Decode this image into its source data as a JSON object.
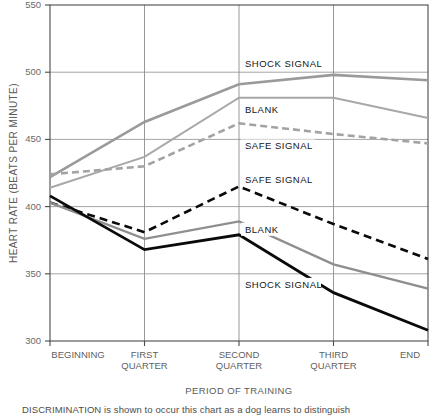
{
  "chart_data": {
    "type": "line",
    "title": "",
    "xlabel": "PERIOD OF TRAINING",
    "ylabel": "HEART RATE (BEATS PER MINUTE)",
    "categories": [
      "BEGINNING",
      "FIRST QUARTER",
      "SECOND QUARTER",
      "THIRD QUARTER",
      "END"
    ],
    "category_lines": [
      [
        "BEGINNING",
        ""
      ],
      [
        "FIRST",
        "QUARTER"
      ],
      [
        "SECOND",
        "QUARTER"
      ],
      [
        "THIRD",
        "QUARTER"
      ],
      [
        "END",
        ""
      ]
    ],
    "ylim": [
      300,
      550
    ],
    "yticks": [
      300,
      350,
      400,
      450,
      500,
      550
    ],
    "ytick_labels": [
      "300",
      "350",
      "400",
      "450",
      "500",
      "550"
    ],
    "grid": true,
    "legend": "inline-annotations",
    "series": [
      {
        "name": "SHOCK SIGNAL (upper)",
        "label": "SHOCK SIGNAL",
        "group": "upper",
        "style": "solid",
        "color": "#9a9a9a",
        "values": [
          422,
          463,
          491,
          498,
          494
        ]
      },
      {
        "name": "BLANK (upper)",
        "label": "BLANK",
        "group": "upper",
        "style": "solid",
        "color": "#a8a8a8",
        "values": [
          414,
          437,
          481,
          481,
          466
        ]
      },
      {
        "name": "SAFE SIGNAL (upper)",
        "label": "SAFE SIGNAL",
        "group": "upper",
        "style": "dashed",
        "color": "#a3a3a3",
        "values": [
          424,
          430,
          462,
          454,
          447
        ]
      },
      {
        "name": "SAFE SIGNAL (lower)",
        "label": "SAFE SIGNAL",
        "group": "lower",
        "style": "dashed",
        "color": "#0a0a0a",
        "values": [
          403,
          381,
          415,
          387,
          361
        ]
      },
      {
        "name": "BLANK (lower)",
        "label": "BLANK",
        "group": "lower",
        "style": "solid",
        "color": "#8e8e8e",
        "values": [
          403,
          376,
          389,
          357,
          339
        ]
      },
      {
        "name": "SHOCK SIGNAL (lower)",
        "label": "SHOCK SIGNAL",
        "group": "lower",
        "style": "solid",
        "color": "#0a0a0a",
        "values": [
          408,
          368,
          379,
          336,
          308
        ]
      }
    ],
    "annotations": [
      {
        "text": "SHOCK SIGNAL",
        "x": 239,
        "y": 505,
        "for": "SHOCK SIGNAL (upper)"
      },
      {
        "text": "BLANK",
        "x": 239,
        "y": 471,
        "for": "BLANK (upper)"
      },
      {
        "text": "SAFE SIGNAL",
        "x": 239,
        "y": 444,
        "for": "SAFE SIGNAL (upper)"
      },
      {
        "text": "SAFE SIGNAL",
        "x": 239,
        "y": 419,
        "for": "SAFE SIGNAL (lower)"
      },
      {
        "text": "BLANK",
        "x": 239,
        "y": 382,
        "for": "BLANK (lower)"
      },
      {
        "text": "SHOCK SIGNAL",
        "x": 239,
        "y": 341,
        "for": "SHOCK SIGNAL (lower)"
      }
    ]
  },
  "caption": {
    "text": "DISCRIMINATION is shown to occur this chart as a dog learns to distinguish"
  }
}
